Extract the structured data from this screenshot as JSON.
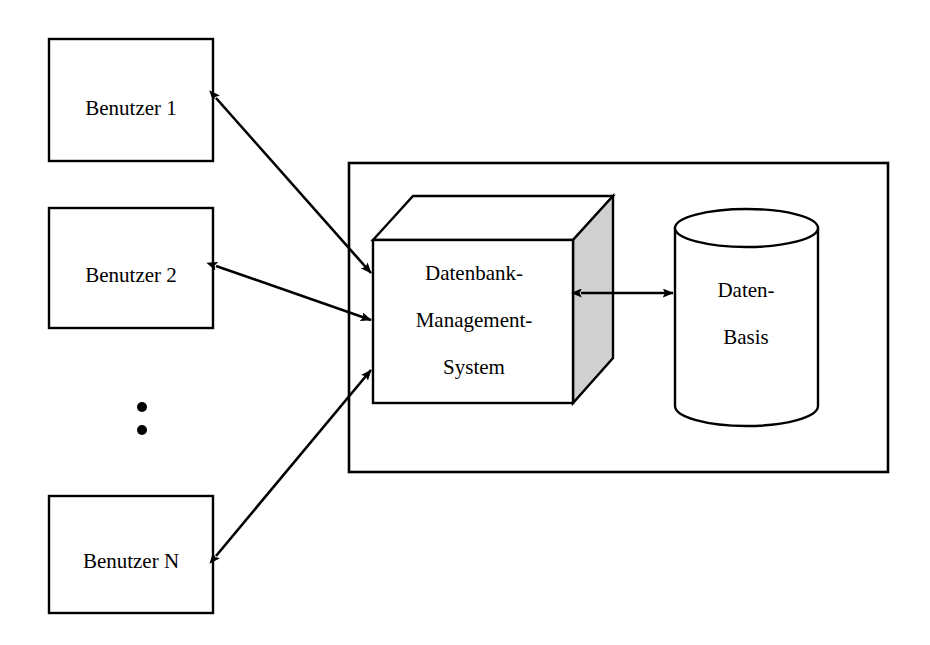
{
  "diagram": {
    "colors": {
      "stroke": "#000000",
      "background": "#ffffff",
      "cube_side_fill": "#d0d0d0",
      "cube_front_fill": "#ffffff"
    },
    "users": [
      {
        "label": "Benutzer 1"
      },
      {
        "label": "Benutzer 2"
      },
      {
        "label": "Benutzer N"
      }
    ],
    "ellipsis": {
      "dots": 2
    },
    "dbms": {
      "line1": "Datenbank-",
      "line2": "Management-",
      "line3": "System"
    },
    "database": {
      "line1": "Daten-",
      "line2": "Basis"
    },
    "connectors": [
      {
        "name": "user-1-dbms",
        "type": "double-arrow"
      },
      {
        "name": "user-2-dbms",
        "type": "double-arrow"
      },
      {
        "name": "user-n-dbms",
        "type": "double-arrow"
      },
      {
        "name": "dbms-database",
        "type": "double-arrow"
      }
    ]
  }
}
